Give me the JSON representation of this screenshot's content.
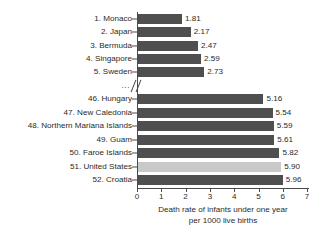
{
  "chart_data": {
    "type": "bar",
    "orientation": "horizontal",
    "title": "",
    "xlabel": "Death rate of infants under one year per 1000 live births",
    "xlabel_line1": "Death rate of infants under one year",
    "xlabel_line2": "per 1000 live births",
    "ylabel": "",
    "xlim": [
      0,
      7
    ],
    "xticks": [
      0,
      1,
      2,
      3,
      4,
      5,
      6,
      7
    ],
    "xtick_labels": [
      "0",
      "1",
      "2",
      "3",
      "4",
      "5",
      "6",
      "7"
    ],
    "grid": false,
    "legend": "none",
    "axis_break": true,
    "axis_break_label": "...",
    "highlight_color": "#c9c9c9",
    "bar_color": "#4f4f4f",
    "categories": [
      "1. Monaco",
      "2. Japan",
      "3. Bermuda",
      "4. Singapore",
      "5. Sweden",
      "46. Hungary",
      "47. New Caledonia",
      "48. Northern Mariana Islands",
      "49. Guam",
      "50. Faroe Islands",
      "51. United States",
      "52. Croatia"
    ],
    "values": [
      1.81,
      2.17,
      2.47,
      2.59,
      2.73,
      5.16,
      5.54,
      5.59,
      5.61,
      5.82,
      5.9,
      5.96
    ],
    "value_labels": [
      "1.81",
      "2.17",
      "2.47",
      "2.59",
      "2.73",
      "5.16",
      "5.54",
      "5.59",
      "5.61",
      "5.82",
      "5.90",
      "5.96"
    ],
    "bars": [
      {
        "label": "1. Monaco",
        "value": 1.81,
        "value_label": "1.81",
        "highlight": false
      },
      {
        "label": "2. Japan",
        "value": 2.17,
        "value_label": "2.17",
        "highlight": false
      },
      {
        "label": "3. Bermuda",
        "value": 2.47,
        "value_label": "2.47",
        "highlight": false
      },
      {
        "label": "4. Singapore",
        "value": 2.59,
        "value_label": "2.59",
        "highlight": false
      },
      {
        "label": "5. Sweden",
        "value": 2.73,
        "value_label": "2.73",
        "highlight": false
      },
      {
        "label": "46. Hungary",
        "value": 5.16,
        "value_label": "5.16",
        "highlight": false
      },
      {
        "label": "47. New Caledonia",
        "value": 5.54,
        "value_label": "5.54",
        "highlight": false
      },
      {
        "label": "48. Northern Mariana Islands",
        "value": 5.59,
        "value_label": "5.59",
        "highlight": false
      },
      {
        "label": "49. Guam",
        "value": 5.61,
        "value_label": "5.61",
        "highlight": false
      },
      {
        "label": "50. Faroe Islands",
        "value": 5.82,
        "value_label": "5.82",
        "highlight": false
      },
      {
        "label": "51. United States",
        "value": 5.9,
        "value_label": "5.90",
        "highlight": true
      },
      {
        "label": "52. Croatia",
        "value": 5.96,
        "value_label": "5.96",
        "highlight": false
      }
    ]
  }
}
